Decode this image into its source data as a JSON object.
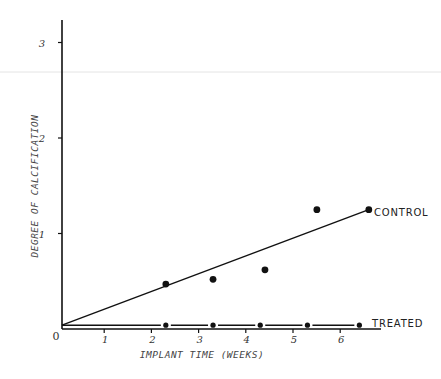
{
  "chart_data": {
    "type": "line",
    "title": "",
    "xlabel": "IMPLANT TIME (WEEKS)",
    "ylabel": "DEGREE OF CALCIFICATION",
    "xlim": [
      0,
      6.8
    ],
    "ylim": [
      0,
      3.3
    ],
    "x_ticks": [
      "0",
      "1",
      "2",
      "3",
      "4",
      "5",
      "6"
    ],
    "y_ticks": [
      "1",
      "2",
      "3"
    ],
    "grid": false,
    "legend_position": "inline-right",
    "series": [
      {
        "name": "CONTROL",
        "points": [
          {
            "x": 2.2,
            "y": 0.47
          },
          {
            "x": 3.2,
            "y": 0.52
          },
          {
            "x": 4.3,
            "y": 0.62
          },
          {
            "x": 5.4,
            "y": 1.25
          },
          {
            "x": 6.5,
            "y": 1.25
          }
        ],
        "fit_line": {
          "from": {
            "x": 0,
            "y": 0.04
          },
          "to": {
            "x": 6.5,
            "y": 1.25
          }
        }
      },
      {
        "name": "TREATED",
        "points": [
          {
            "x": 2.2,
            "y": 0.04
          },
          {
            "x": 3.2,
            "y": 0.04
          },
          {
            "x": 4.2,
            "y": 0.04
          },
          {
            "x": 5.2,
            "y": 0.04
          },
          {
            "x": 6.3,
            "y": 0.04
          }
        ],
        "fit_line": {
          "from": {
            "x": 0,
            "y": 0.04
          },
          "to": {
            "x": 6.3,
            "y": 0.04
          }
        }
      }
    ]
  },
  "labels": {
    "origin": "0",
    "control": "CONTROL",
    "treated": "TREATED"
  }
}
